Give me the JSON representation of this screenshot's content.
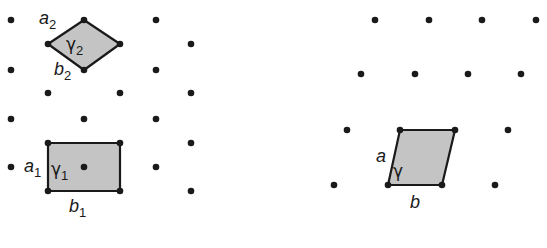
{
  "colors": {
    "dot": "#1a1a1a",
    "cell_fill": "#c4c4c4",
    "cell_stroke": "#1a1a1a",
    "background": "#ffffff"
  },
  "left_lattice": {
    "description": "Centered rectangular lattice with two alternative unit cells",
    "points": [
      [
        11,
        20
      ],
      [
        84,
        20
      ],
      [
        156,
        20
      ],
      [
        48,
        44
      ],
      [
        120,
        44
      ],
      [
        191,
        44
      ],
      [
        11,
        70
      ],
      [
        84,
        70
      ],
      [
        156,
        70
      ],
      [
        48,
        93
      ],
      [
        120,
        93
      ],
      [
        191,
        93
      ],
      [
        11,
        119
      ],
      [
        84,
        119
      ],
      [
        156,
        119
      ],
      [
        48,
        143
      ],
      [
        120,
        143
      ],
      [
        191,
        143
      ],
      [
        11,
        167
      ],
      [
        84,
        167
      ],
      [
        156,
        167
      ],
      [
        48,
        191
      ],
      [
        120,
        191
      ],
      [
        191,
        191
      ]
    ],
    "cell_primitive": {
      "name": "rhombus",
      "vertices": [
        [
          84,
          20
        ],
        [
          120,
          44
        ],
        [
          84,
          70
        ],
        [
          48,
          44
        ]
      ],
      "labels": {
        "a": "a",
        "a_sub": "2",
        "b": "b",
        "b_sub": "2",
        "gamma": "γ",
        "gamma_sub": "2"
      }
    },
    "cell_centered": {
      "name": "rectangle",
      "vertices": [
        [
          48,
          143
        ],
        [
          120,
          143
        ],
        [
          120,
          191
        ],
        [
          48,
          191
        ]
      ],
      "labels": {
        "a": "a",
        "a_sub": "1",
        "b": "b",
        "b_sub": "1",
        "gamma": "γ",
        "gamma_sub": "1"
      }
    }
  },
  "right_lattice": {
    "description": "Oblique lattice with primitive parallelogram cell",
    "points": [
      [
        375,
        20
      ],
      [
        429,
        20
      ],
      [
        482,
        20
      ],
      [
        536,
        20
      ],
      [
        361,
        74
      ],
      [
        415,
        74
      ],
      [
        468,
        74
      ],
      [
        521,
        74
      ],
      [
        347,
        130
      ],
      [
        400,
        130
      ],
      [
        455,
        130
      ],
      [
        508,
        130
      ],
      [
        334,
        185
      ],
      [
        388,
        185
      ],
      [
        442,
        185
      ],
      [
        495,
        185
      ]
    ],
    "cell": {
      "name": "parallelogram",
      "vertices": [
        [
          400,
          130
        ],
        [
          455,
          130
        ],
        [
          442,
          185
        ],
        [
          388,
          185
        ]
      ],
      "labels": {
        "a": "a",
        "b": "b",
        "gamma": "γ"
      }
    }
  }
}
